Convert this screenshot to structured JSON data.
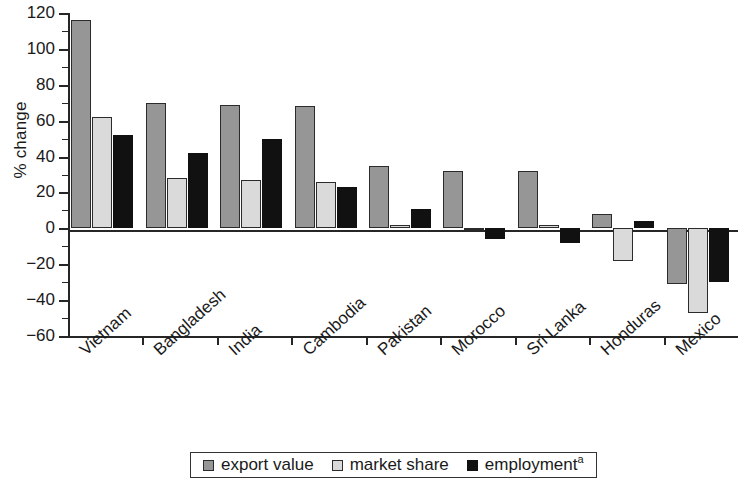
{
  "chart_data": {
    "type": "bar",
    "title": "",
    "xlabel": "",
    "ylabel": "% change",
    "ylim": [
      -60,
      120
    ],
    "ytick_step": 20,
    "grid": false,
    "legend_position": "bottom",
    "categories": [
      "Vietnam",
      "Bangladesh",
      "India",
      "Cambodia",
      "Pakistan",
      "Morocco",
      "Sri Lanka",
      "Honduras",
      "Mexico"
    ],
    "series": [
      {
        "name": "export value",
        "color": "#969696",
        "values": [
          116,
          70,
          69,
          68,
          35,
          32,
          32,
          8,
          -31
        ]
      },
      {
        "name": "market share",
        "color": "#dadada",
        "values": [
          62,
          28,
          27,
          26,
          2,
          -1,
          2,
          -18,
          -47
        ]
      },
      {
        "name": "employment",
        "color": "#111111",
        "values": [
          52,
          42,
          50,
          23,
          11,
          -6,
          -8,
          4,
          -30
        ]
      }
    ],
    "ytick_labels": [
      "120",
      "100",
      "80",
      "60",
      "40",
      "20",
      "0",
      "−20",
      "−40",
      "−60"
    ],
    "ytick_values": [
      120,
      100,
      80,
      60,
      40,
      20,
      0,
      -20,
      -40,
      -60
    ],
    "legend": [
      {
        "label": "export value",
        "swatch": "export"
      },
      {
        "label": "market share",
        "swatch": "share"
      },
      {
        "label": "employment",
        "swatch": "employ",
        "footnote": "a"
      }
    ],
    "footnote_marker": "a"
  }
}
